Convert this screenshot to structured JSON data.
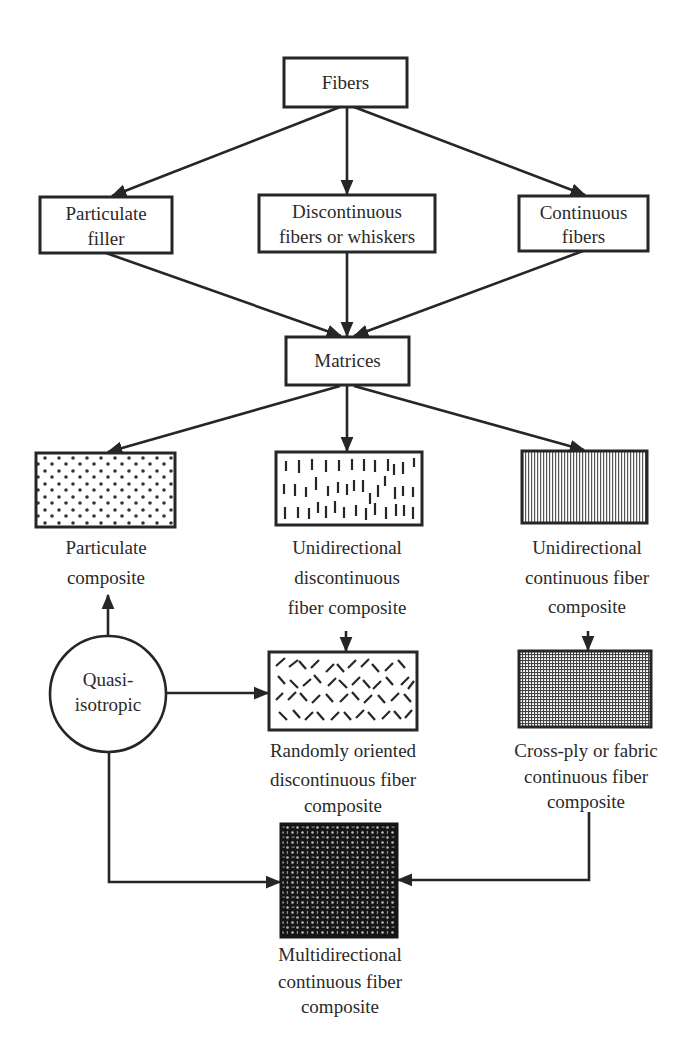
{
  "diagram": {
    "type": "flowchart",
    "title": "",
    "nodes": {
      "fibers": {
        "label": "Fibers"
      },
      "particulate_filler": {
        "line1": "Particulate",
        "line2": "filler"
      },
      "discontinuous_fibers": {
        "line1": "Discontinuous",
        "line2": "fibers or whiskers"
      },
      "continuous_fibers": {
        "line1": "Continuous",
        "line2": "fibers"
      },
      "matrices": {
        "label": "Matrices"
      },
      "particulate_composite": {
        "line1": "Particulate",
        "line2": "composite",
        "pattern": "dots"
      },
      "unidirectional_discontinuous": {
        "line1": "Unidirectional",
        "line2": "discontinuous",
        "line3": "fiber composite",
        "pattern": "short-vertical-dashes"
      },
      "unidirectional_continuous": {
        "line1": "Unidirectional",
        "line2": "continuous fiber",
        "line3": "composite",
        "pattern": "vertical-lines"
      },
      "quasi_isotropic": {
        "line1": "Quasi-",
        "line2": "isotropic",
        "shape": "circle"
      },
      "randomly_oriented": {
        "line1": "Randomly oriented",
        "line2": "discontinuous fiber",
        "line3": "composite",
        "pattern": "random-diagonal-dashes"
      },
      "cross_ply": {
        "line1": "Cross-ply or fabric",
        "line2": "continuous fiber",
        "line3": "composite",
        "pattern": "grid"
      },
      "multidirectional": {
        "line1": "Multidirectional",
        "line2": "continuous fiber",
        "line3": "composite",
        "pattern": "dense-weave"
      }
    },
    "edges": [
      {
        "from": "Fibers",
        "to": "Particulate filler"
      },
      {
        "from": "Fibers",
        "to": "Discontinuous fibers or whiskers"
      },
      {
        "from": "Fibers",
        "to": "Continuous fibers"
      },
      {
        "from": "Particulate filler",
        "to": "Matrices"
      },
      {
        "from": "Discontinuous fibers or whiskers",
        "to": "Matrices"
      },
      {
        "from": "Continuous fibers",
        "to": "Matrices"
      },
      {
        "from": "Matrices",
        "to": "Particulate composite"
      },
      {
        "from": "Matrices",
        "to": "Unidirectional discontinuous fiber composite"
      },
      {
        "from": "Matrices",
        "to": "Unidirectional continuous fiber composite"
      },
      {
        "from": "Unidirectional discontinuous fiber composite",
        "to": "Randomly oriented discontinuous fiber composite"
      },
      {
        "from": "Unidirectional continuous fiber composite",
        "to": "Cross-ply or fabric continuous fiber composite"
      },
      {
        "from": "Quasi-isotropic",
        "to": "Particulate composite"
      },
      {
        "from": "Quasi-isotropic",
        "to": "Randomly oriented discontinuous fiber composite"
      },
      {
        "from": "Quasi-isotropic",
        "to": "Multidirectional continuous fiber composite"
      },
      {
        "from": "Cross-ply or fabric continuous fiber composite",
        "to": "Multidirectional continuous fiber composite"
      }
    ],
    "colors": {
      "ink": "#262626",
      "background": "#ffffff"
    }
  }
}
